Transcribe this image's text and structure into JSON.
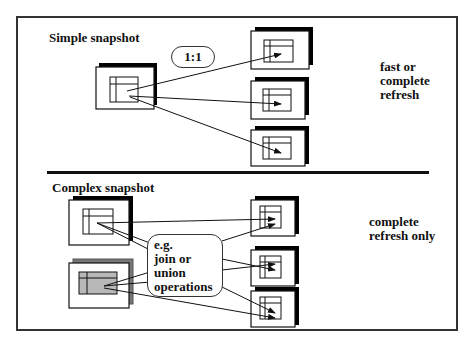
{
  "diagram": {
    "simple_section": {
      "title": "Simple snapshot",
      "ratio_label": "1:1",
      "note_lines": [
        "fast or",
        "complete",
        "refresh"
      ],
      "source_tables": 1,
      "target_tables": 3
    },
    "complex_section": {
      "title": "Complex snapshot",
      "operation_lines": [
        "e.g.",
        "join or union",
        "operations"
      ],
      "note_lines": [
        "complete",
        "refresh only"
      ],
      "source_tables": 2,
      "target_tables": 3
    },
    "colors": {
      "stroke": "#111111",
      "shadow": "#000000",
      "shaded_source_fill": "#b8b8b8",
      "shaded_source_shadow": "#777777",
      "background": "#ffffff"
    }
  }
}
